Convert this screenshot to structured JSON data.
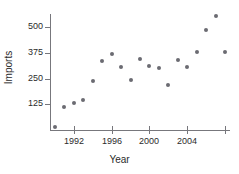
{
  "chart_data": {
    "type": "scatter",
    "title": "",
    "xlabel": "Year",
    "ylabel": "Imports",
    "grid": false,
    "legend": null,
    "marker": {
      "shape": "circle",
      "color": "#6b6b72",
      "size_px": 4
    },
    "xlim": [
      1989.5,
      2008.5
    ],
    "ylim": [
      0,
      575
    ],
    "xticks": [
      1992,
      1996,
      2000,
      2004,
      2008
    ],
    "xtick_labels": [
      "1992",
      "1996",
      "2000",
      "2004",
      ""
    ],
    "yticks": [
      125,
      250,
      375,
      500
    ],
    "ytick_labels": [
      "125",
      "250",
      "375",
      "500"
    ],
    "x": [
      1990,
      1991,
      1992,
      1993,
      1994,
      1995,
      1996,
      1997,
      1998,
      1999,
      2000,
      2001,
      2002,
      2003,
      2004,
      2005,
      2006,
      2007,
      2008
    ],
    "y": [
      15,
      110,
      130,
      145,
      240,
      335,
      370,
      305,
      245,
      345,
      310,
      300,
      220,
      340,
      305,
      380,
      485,
      555,
      380
    ],
    "points": [
      {
        "x": 1990,
        "y": 15
      },
      {
        "x": 1991,
        "y": 110
      },
      {
        "x": 1992,
        "y": 130
      },
      {
        "x": 1993,
        "y": 145
      },
      {
        "x": 1994,
        "y": 240
      },
      {
        "x": 1995,
        "y": 335
      },
      {
        "x": 1996,
        "y": 370
      },
      {
        "x": 1997,
        "y": 305
      },
      {
        "x": 1998,
        "y": 245
      },
      {
        "x": 1999,
        "y": 345
      },
      {
        "x": 2000,
        "y": 310
      },
      {
        "x": 2001,
        "y": 300
      },
      {
        "x": 2002,
        "y": 220
      },
      {
        "x": 2003,
        "y": 340
      },
      {
        "x": 2004,
        "y": 305
      },
      {
        "x": 2005,
        "y": 380
      },
      {
        "x": 2006,
        "y": 485
      },
      {
        "x": 2007,
        "y": 555
      },
      {
        "x": 2008,
        "y": 380
      }
    ]
  },
  "colors": {
    "marker": "#6b6b72",
    "axis": "#77777c",
    "text": "#2b2b2b",
    "background": "#ffffff"
  }
}
